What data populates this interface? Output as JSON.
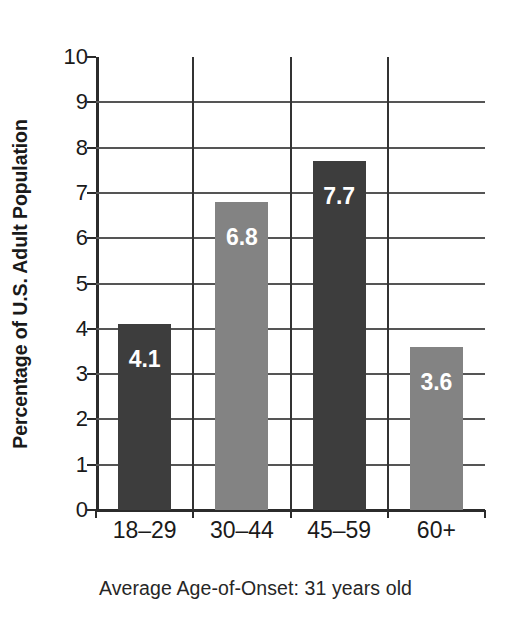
{
  "chart_data": {
    "type": "bar",
    "title": "",
    "subtitle": "",
    "xlabel": "",
    "ylabel": "Percentage of U.S. Adult Population",
    "categories": [
      "18–29",
      "30–44",
      "45–59",
      "60+"
    ],
    "values": [
      4.1,
      6.8,
      7.7,
      3.6
    ],
    "value_labels": [
      "4.1",
      "6.8",
      "7.7",
      "3.6"
    ],
    "bar_colors": [
      "#3d3d3d",
      "#838383",
      "#3d3d3d",
      "#838383"
    ],
    "value_label_color": "#ffffff",
    "ylim": [
      0,
      10
    ],
    "ytick_labels": [
      "0",
      "1",
      "2",
      "3",
      "4",
      "5",
      "6",
      "7",
      "8",
      "9",
      "10"
    ],
    "ytick_values": [
      0,
      1,
      2,
      3,
      4,
      5,
      6,
      7,
      8,
      9,
      10
    ],
    "grid": {
      "horizontal": true,
      "vertical": true,
      "color": "#555555"
    },
    "legend": {
      "visible": false,
      "position": "none",
      "entries": []
    },
    "annotations": [
      {
        "name": "footnote",
        "text": "Average Age-of-Onset: 31 years old",
        "position": "below-axis-center"
      }
    ]
  },
  "figure": {
    "background_color": "#ffffff",
    "axis_color": "#2b2b2b",
    "text_color": "#1a1a1a",
    "caption": "Average Age-of-Onset: 31 years old"
  }
}
